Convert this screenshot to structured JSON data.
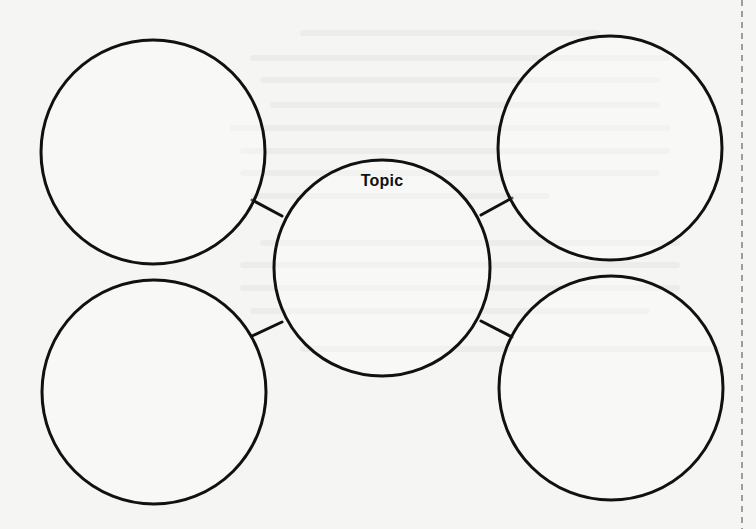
{
  "diagram": {
    "type": "concept-web",
    "center": {
      "label": "Topic",
      "cx": 382,
      "cy": 268,
      "r": 108
    },
    "satellites": [
      {
        "id": "top-left",
        "cx": 153,
        "cy": 152,
        "r": 112,
        "label": ""
      },
      {
        "id": "top-right",
        "cx": 610,
        "cy": 148,
        "r": 112,
        "label": ""
      },
      {
        "id": "bottom-left",
        "cx": 154,
        "cy": 392,
        "r": 112,
        "label": ""
      },
      {
        "id": "bottom-right",
        "cx": 611,
        "cy": 388,
        "r": 112,
        "label": ""
      }
    ],
    "connectors": [
      {
        "from": "top-left",
        "x1": 252,
        "y1": 200,
        "x2": 282,
        "y2": 216
      },
      {
        "from": "top-right",
        "x1": 512,
        "y1": 198,
        "x2": 481,
        "y2": 215
      },
      {
        "from": "bottom-left",
        "x1": 252,
        "y1": 336,
        "x2": 282,
        "y2": 322
      },
      {
        "from": "bottom-right",
        "x1": 512,
        "y1": 337,
        "x2": 481,
        "y2": 321
      }
    ],
    "colors": {
      "paper": "#f5f5f3",
      "stroke": "#111111",
      "text": "#111111",
      "cut_line": "#444444"
    }
  }
}
